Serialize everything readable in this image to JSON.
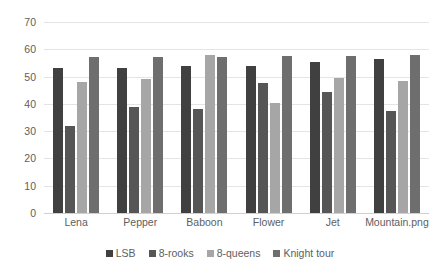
{
  "chart_data": {
    "type": "bar",
    "title": "",
    "subtitle": "",
    "xlabel": "",
    "ylabel": "",
    "ylim": [
      0,
      70
    ],
    "yticks": [
      0,
      10,
      20,
      30,
      40,
      50,
      60,
      70
    ],
    "grid": true,
    "legend_position": "bottom",
    "categories": [
      "Lena",
      "Pepper",
      "Baboon",
      "Flower",
      "Jet",
      "Mountain.png"
    ],
    "series": [
      {
        "name": "LSB",
        "color": "#404040",
        "values": [
          53,
          53,
          54,
          54,
          55.5,
          56.5
        ]
      },
      {
        "name": "8-rooks",
        "color": "#565656",
        "values": [
          32,
          39,
          38,
          47.5,
          44.5,
          37.5
        ]
      },
      {
        "name": "8-queens",
        "color": "#a6a6a6",
        "values": [
          48,
          49,
          58,
          40.5,
          49.5,
          48.5
        ]
      },
      {
        "name": "Knight tour",
        "color": "#6e6e6e",
        "values": [
          57,
          57,
          57,
          57.5,
          57.5,
          58
        ]
      }
    ]
  },
  "axis": {
    "y_tick_labels": [
      "70",
      "60",
      "50",
      "40",
      "30",
      "20",
      "10",
      "0"
    ],
    "x_tick_labels": [
      "Lena",
      "Pepper",
      "Baboon",
      "Flower",
      "Jet",
      "Mountain.png"
    ]
  },
  "legend": {
    "items": [
      {
        "label": "LSB",
        "color": "#404040"
      },
      {
        "label": "8-rooks",
        "color": "#565656"
      },
      {
        "label": "8-queens",
        "color": "#a6a6a6"
      },
      {
        "label": "Knight tour",
        "color": "#6e6e6e"
      }
    ]
  },
  "style": {
    "background": "#ffffff",
    "gridline_color": "#e4e4e4",
    "baseline_color": "#d0d0d0",
    "text_color": "#5e5e5e"
  }
}
